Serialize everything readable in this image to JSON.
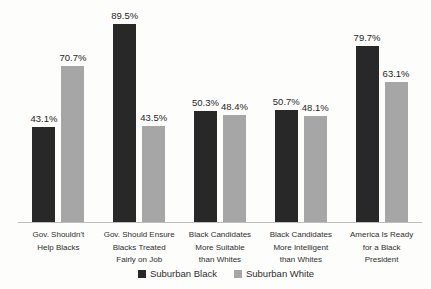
{
  "chart_data": {
    "type": "bar",
    "title": "",
    "xlabel": "",
    "ylabel": "",
    "ylim": [
      0,
      100
    ],
    "grid": false,
    "legend_position": "bottom-center",
    "categories": [
      "Gov. Shouldn't Help Blacks",
      "Gov. Should Ensure Blacks Treated Fairly on Job",
      "Black Candidates More Suitable than Whites",
      "Black Candidates More Intelligent than Whites",
      "America Is Ready for a Black President"
    ],
    "category_lines": [
      [
        "Gov. Shouldn't",
        "Help Blacks"
      ],
      [
        "Gov. Should Ensure",
        "Blacks Treated",
        "Fairly on Job"
      ],
      [
        "Black Candidates",
        "More Suitable",
        "than Whites"
      ],
      [
        "Black Candidates",
        "More Intelligent",
        "than Whites"
      ],
      [
        "America Is Ready",
        "for a Black",
        "President"
      ]
    ],
    "series": [
      {
        "name": "Suburban Black",
        "color": "#282828",
        "values": [
          43.1,
          89.5,
          50.3,
          50.7,
          79.7
        ],
        "labels": [
          "43.1%",
          "89.5%",
          "50.3%",
          "50.7%",
          "79.7%"
        ]
      },
      {
        "name": "Suburban White",
        "color": "#a6a6a6",
        "values": [
          70.7,
          43.5,
          48.4,
          48.1,
          63.1
        ],
        "labels": [
          "70.7%",
          "43.5%",
          "48.4%",
          "48.1%",
          "63.1%"
        ]
      }
    ],
    "colors": {
      "axis_line": "#bdbdbd",
      "label_text": "#262626",
      "background": "#fdfdfc"
    }
  }
}
